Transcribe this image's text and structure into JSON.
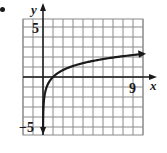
{
  "chart_data": {
    "type": "line",
    "title": "",
    "function": "y = ln(x)",
    "xlabel": "x",
    "ylabel": "y",
    "xlim": [
      -2,
      10
    ],
    "ylim": [
      -6,
      6
    ],
    "grid": true,
    "x_tick_labels": [
      {
        "value": 9,
        "label": "9"
      }
    ],
    "y_tick_labels": [
      {
        "value": 5,
        "label": "5"
      },
      {
        "value": -5,
        "label": "−5"
      }
    ],
    "series": [
      {
        "name": "curve",
        "x": [
          0.0067,
          0.02,
          0.05,
          0.1,
          0.2,
          0.4,
          0.7,
          1,
          1.5,
          2,
          3,
          4,
          5,
          6,
          7,
          8,
          9,
          10
        ],
        "y": [
          -5,
          -3.91,
          -3.0,
          -2.3,
          -1.61,
          -0.92,
          -0.36,
          0,
          0.41,
          0.69,
          1.1,
          1.39,
          1.61,
          1.79,
          1.95,
          2.08,
          2.2,
          2.3
        ]
      }
    ],
    "arrows": [
      "curve-end-right",
      "curve-end-down",
      "x-axis-right",
      "y-axis-up"
    ]
  },
  "labels": {
    "x_axis": "x",
    "y_axis": "y",
    "tick_x_9": "9",
    "tick_y_5": "5",
    "tick_y_neg5": "−5"
  },
  "colors": {
    "grid": "#8a8a8a",
    "axis": "#1a1a1a",
    "curve": "#1a1a1a",
    "background": "#ffffff"
  }
}
